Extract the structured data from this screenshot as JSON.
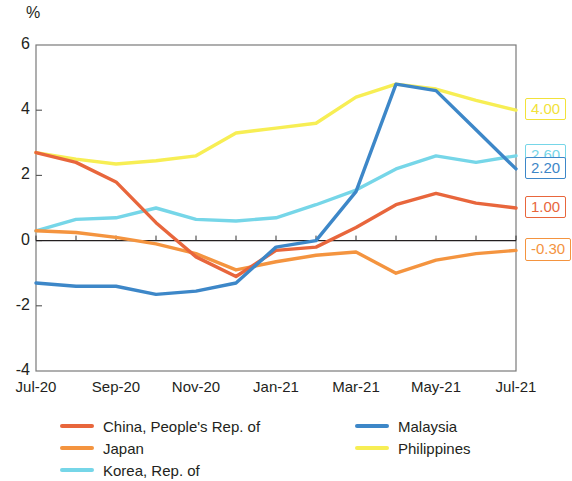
{
  "chart_data": {
    "type": "line",
    "title": "",
    "subtitle": "",
    "xlabel": "",
    "ylabel": "%",
    "unit_label": "%",
    "x": [
      "Jul-20",
      "Aug-20",
      "Sep-20",
      "Oct-20",
      "Nov-20",
      "Dec-20",
      "Jan-21",
      "Feb-21",
      "Mar-21",
      "Apr-21",
      "May-21",
      "Jun-21",
      "Jul-21"
    ],
    "xtick_labels": [
      "Jul-20",
      "Sep-20",
      "Nov-20",
      "Jan-21",
      "Mar-21",
      "May-21",
      "Jul-21"
    ],
    "xtick_indices": [
      0,
      2,
      4,
      6,
      8,
      10,
      12
    ],
    "ytick_labels": [
      "6",
      "4",
      "2",
      "0",
      "-2",
      "-4"
    ],
    "ytick_values": [
      6,
      4,
      2,
      0,
      -2,
      -4
    ],
    "ylim": [
      -4,
      6
    ],
    "grid": false,
    "legend_position": "bottom",
    "zero_line": true,
    "series": [
      {
        "name": "China, People's Rep. of",
        "color": "#e8663c",
        "end_label": "1.00",
        "values": [
          2.7,
          2.4,
          1.8,
          0.55,
          -0.5,
          -1.1,
          -0.3,
          -0.2,
          0.4,
          1.1,
          1.45,
          1.15,
          1.0
        ]
      },
      {
        "name": "Japan",
        "color": "#f4943f",
        "end_label": "-0.30",
        "values": [
          0.3,
          0.25,
          0.1,
          -0.1,
          -0.4,
          -0.9,
          -0.65,
          -0.45,
          -0.35,
          -1.0,
          -0.6,
          -0.4,
          -0.3
        ]
      },
      {
        "name": "Korea, Rep. of",
        "color": "#76d6e8",
        "end_label": "2.60",
        "values": [
          0.3,
          0.65,
          0.7,
          1.0,
          0.65,
          0.6,
          0.7,
          1.1,
          1.55,
          2.2,
          2.6,
          2.4,
          2.6
        ]
      },
      {
        "name": "Malaysia",
        "color": "#3d87c8",
        "end_label": "2.20",
        "values": [
          -1.3,
          -1.4,
          -1.4,
          -1.65,
          -1.55,
          -1.3,
          -0.2,
          0.0,
          1.5,
          4.8,
          4.6,
          3.4,
          2.2
        ]
      },
      {
        "name": "Philippines",
        "color": "#f7ee54",
        "end_label": "4.00",
        "values": [
          2.7,
          2.5,
          2.35,
          2.45,
          2.6,
          3.3,
          3.45,
          3.6,
          4.4,
          4.8,
          4.65,
          4.3,
          4.0
        ]
      }
    ]
  },
  "legend": {
    "column_left": [
      "China, People's Rep. of",
      "Japan",
      "Korea, Rep. of"
    ],
    "column_right": [
      "Malaysia",
      "Philippines"
    ]
  },
  "end_labels": [
    {
      "text": "4.00",
      "color": "#f2e23a",
      "series": "Philippines"
    },
    {
      "text": "2.60",
      "color": "#76d6e8",
      "series": "Korea, Rep. of"
    },
    {
      "text": "2.20",
      "color": "#3d87c8",
      "series": "Malaysia"
    },
    {
      "text": "1.00",
      "color": "#e8663c",
      "series": "China, People's Rep. of"
    },
    {
      "text": "-0.30",
      "color": "#f4943f",
      "series": "Japan"
    }
  ]
}
